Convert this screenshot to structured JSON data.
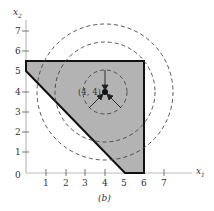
{
  "figure": {
    "caption": "(b)",
    "x_axis_label": "x",
    "x_axis_sub": "1",
    "y_axis_label": "x",
    "y_axis_sub": "2",
    "x_ticks": [
      "1",
      "2",
      "3",
      "4",
      "5",
      "6",
      "7"
    ],
    "y_ticks": [
      "0",
      "1",
      "2",
      "3",
      "4",
      "5",
      "6",
      "7"
    ],
    "point_label": "(4, 4)",
    "polygon_vertices": [
      [
        0,
        5.5
      ],
      [
        6,
        5.5
      ],
      [
        6,
        0
      ],
      [
        5,
        0
      ],
      [
        0,
        5
      ]
    ],
    "point": [
      4,
      4
    ],
    "circle_radii": [
      1.1,
      2.5,
      3.4
    ],
    "colors": {
      "fill": "#b3b3b3",
      "stroke": "#111111",
      "axis": "#aaaaaa"
    }
  }
}
